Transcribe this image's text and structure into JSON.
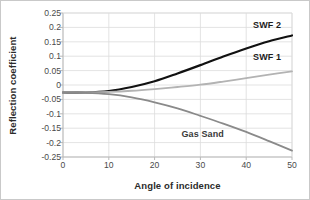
{
  "chart_data": {
    "type": "line",
    "title": "",
    "xlabel": "Angle of incidence",
    "ylabel": "Reflection coefficient",
    "xlim": [
      0,
      50
    ],
    "ylim": [
      -0.25,
      0.25
    ],
    "xticks": [
      "0",
      "10",
      "20",
      "30",
      "40",
      "50"
    ],
    "xtick_values": [
      0,
      10,
      20,
      30,
      40,
      50
    ],
    "yticks": [
      "0.25",
      "0.2",
      "0.15",
      "0.1",
      "0.05",
      "0",
      "-0.05",
      "-0.1",
      "-0.15",
      "-0.2",
      "-0.25"
    ],
    "ytick_values": [
      0.25,
      0.2,
      0.15,
      0.1,
      0.05,
      0,
      -0.05,
      -0.1,
      -0.15,
      -0.2,
      -0.25
    ],
    "grid": true,
    "legend_position": "inline-annotations",
    "x": [
      0,
      5,
      10,
      15,
      20,
      25,
      30,
      35,
      40,
      45,
      50
    ],
    "series": [
      {
        "name": "SWF 2",
        "color": "#111111",
        "width": 2.2,
        "values": [
          -0.026,
          -0.026,
          -0.021,
          -0.007,
          0.013,
          0.04,
          0.069,
          0.099,
          0.127,
          0.152,
          0.172
        ],
        "label_x": 41.5,
        "label_y": 0.205
      },
      {
        "name": "SWF 1",
        "color": "#b3b3b3",
        "width": 1.8,
        "values": [
          -0.026,
          -0.026,
          -0.024,
          -0.02,
          -0.014,
          -0.007,
          0.001,
          0.012,
          0.024,
          0.036,
          0.047
        ],
        "label_x": 41.5,
        "label_y": 0.095
      },
      {
        "name": "Gas Sand",
        "color": "#8a8a8a",
        "width": 1.8,
        "values": [
          -0.026,
          -0.027,
          -0.032,
          -0.043,
          -0.06,
          -0.081,
          -0.107,
          -0.134,
          -0.163,
          -0.195,
          -0.228
        ],
        "label_x": 30.5,
        "label_y": -0.172
      }
    ]
  },
  "labels": {
    "xlabel": "Angle of incidence",
    "ylabel": "Reflection coefficient",
    "series_swf2": "SWF 2",
    "series_swf1": "SWF 1",
    "series_gas": "Gas Sand",
    "ytick_0": "0.25",
    "ytick_1": "0.2",
    "ytick_2": "0.15",
    "ytick_3": "0.1",
    "ytick_4": "0.05",
    "ytick_5": "0",
    "ytick_6": "-0.05",
    "ytick_7": "-0.1",
    "ytick_8": "-0.15",
    "ytick_9": "-0.2",
    "ytick_10": "-0.25",
    "xtick_0": "0",
    "xtick_1": "10",
    "xtick_2": "20",
    "xtick_3": "30",
    "xtick_4": "40",
    "xtick_5": "50"
  },
  "colors": {
    "background": "#ffffff",
    "grid": "#dcdcdc",
    "axis": "#b9b9b9",
    "border": "#c9c9c9",
    "text": "#2b2b2b"
  }
}
